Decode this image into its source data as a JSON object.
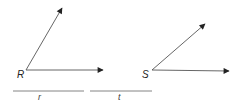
{
  "diagram": {
    "type": "geometry-angles",
    "angles": [
      {
        "vertex_label": "R",
        "vertex": [
          26,
          70
        ],
        "rays": [
          [
            62,
            8
          ],
          [
            103,
            70
          ]
        ]
      },
      {
        "vertex_label": "S",
        "vertex": [
          152,
          70
        ],
        "rays": [
          [
            205,
            24
          ],
          [
            229,
            71
          ]
        ]
      }
    ],
    "segments": [
      {
        "label": "r",
        "from": [
          13,
          91
        ],
        "to": [
          84,
          91
        ]
      },
      {
        "label": "t",
        "from": [
          90,
          91
        ],
        "to": [
          152,
          91
        ]
      }
    ],
    "colors": {
      "stroke": "#555555",
      "label": "#222222"
    }
  }
}
